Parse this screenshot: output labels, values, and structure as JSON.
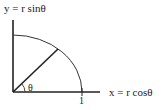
{
  "diagram": {
    "type": "polar-coordinates-unit-arc",
    "labels": {
      "y_axis": "y = r sinθ",
      "x_axis": "x = r cosθ",
      "angle": "θ",
      "unit_tick": "1"
    },
    "colors": {
      "stroke": "#222222",
      "background": "#ffffff"
    }
  }
}
